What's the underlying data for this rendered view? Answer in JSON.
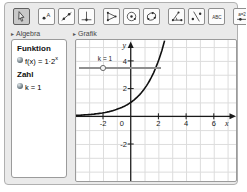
{
  "app": {
    "name": "GeoGebra-style applet"
  },
  "toolbar": {
    "buttons": [
      {
        "name": "move",
        "selected": true
      },
      {
        "name": "point",
        "icon_text": "A",
        "selected": false
      },
      {
        "name": "line",
        "selected": false
      },
      {
        "name": "perpendicular-line",
        "selected": false
      },
      {
        "name": "polygon",
        "selected": false
      },
      {
        "name": "circle-with-center",
        "selected": false
      },
      {
        "name": "circle-through-points",
        "selected": false
      },
      {
        "name": "angle",
        "selected": false
      },
      {
        "name": "reflect-about-line",
        "selected": false
      },
      {
        "name": "text",
        "icon_text": "ABC",
        "selected": false
      },
      {
        "name": "slider",
        "icon_text": "a=2",
        "selected": false
      }
    ]
  },
  "panels": {
    "algebra": {
      "header": "Algebra",
      "groups": [
        {
          "title": "Funktion",
          "items": [
            {
              "label_base": "f(x) = 1·2",
              "label_sup": "x"
            }
          ]
        },
        {
          "title": "Zahl",
          "items": [
            {
              "label_base": "k = 1",
              "label_sup": ""
            }
          ]
        }
      ]
    },
    "grafik": {
      "header": "Grafik",
      "slider": {
        "label": "k = 1",
        "value": 1
      },
      "x_ticks": [
        "-2",
        "0",
        "2",
        "4",
        "6"
      ],
      "y_ticks": [
        "4",
        "2",
        "-2"
      ],
      "x_axis_label": "x",
      "y_axis_label": "y",
      "function": {
        "coef": 1,
        "base": 2
      }
    }
  },
  "chart_data": {
    "type": "line",
    "title": "",
    "function": "f(x) = 1·2^x",
    "x": [
      -4,
      -3,
      -2,
      -1,
      0,
      1,
      2,
      2.4
    ],
    "values": [
      0.0625,
      0.125,
      0.25,
      0.5,
      1,
      2,
      4,
      5.28
    ],
    "xlabel": "x",
    "ylabel": "y",
    "xlim": [
      -4,
      7.6
    ],
    "ylim": [
      -4.7,
      5.5
    ],
    "grid": true,
    "annotations": [
      {
        "label": "k = 1",
        "kind": "slider",
        "value": 1
      }
    ]
  }
}
